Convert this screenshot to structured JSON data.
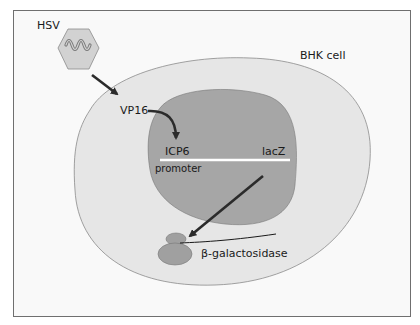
{
  "diagram": {
    "labels": {
      "virus": "HSV",
      "cell": "BHK cell",
      "activator": "VP16",
      "promoter_name": "ICP6",
      "promoter_word": "promoter",
      "reporter_gene": "lacZ",
      "protein": "β-galactosidase"
    },
    "colors": {
      "background": "#f9f9f9",
      "cytoplasm": "#e6e6e6",
      "nucleus": "#a6a6a6",
      "virus_capsid": "#d2d2d2",
      "arrow": "#2b2b2b",
      "dna_line": "#ffffff",
      "protein": "#a0a0a0"
    }
  }
}
